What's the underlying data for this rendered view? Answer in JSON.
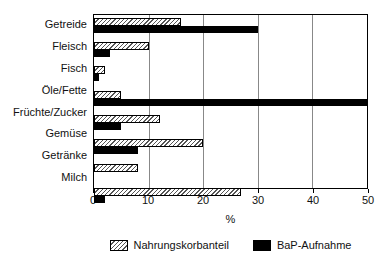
{
  "chart_data": {
    "type": "bar",
    "orientation": "horizontal",
    "categories": [
      "Getreide",
      "Fleisch",
      "Fisch",
      "Öle/Fette",
      "Früchte/Zucker",
      "Gemüse",
      "Getränke",
      "Milch"
    ],
    "series": [
      {
        "name": "Nahrungskorbanteil",
        "style": "hatched",
        "values": [
          16,
          10,
          2,
          5,
          12,
          20,
          8,
          27
        ]
      },
      {
        "name": "BaP-Aufnahme",
        "style": "solid-black",
        "values": [
          30,
          3,
          1,
          50,
          5,
          8,
          0,
          2
        ]
      }
    ],
    "title": "",
    "xlabel": "%",
    "ylabel": "",
    "xlim": [
      0,
      50
    ],
    "xticks": [
      0,
      10,
      20,
      30,
      40,
      50
    ],
    "grid": true,
    "legend_position": "bottom"
  },
  "colors": {
    "bar_black": "#000000",
    "hatch_line": "#555555",
    "grid_line": "#888888",
    "frame": "#000000",
    "text": "#111111",
    "background": "#ffffff"
  }
}
